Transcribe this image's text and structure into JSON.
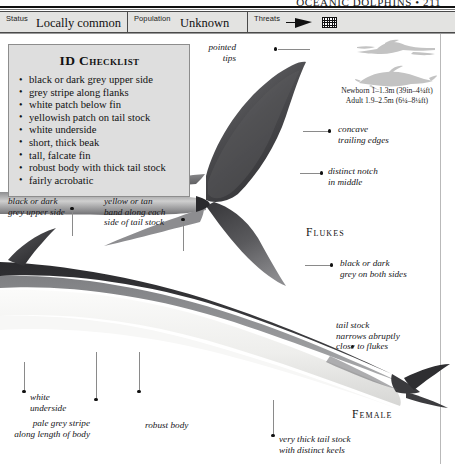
{
  "running_head": "OCEANIC DOLPHINS • 211",
  "status_bar": [
    {
      "label": "Status",
      "value": "Locally common",
      "name": "status"
    },
    {
      "label": "Population",
      "value": "Unknown",
      "name": "population"
    },
    {
      "label": "Threats",
      "value": "",
      "name": "threats",
      "icons": [
        "harpoon-icon",
        "fishing-net-icon"
      ]
    }
  ],
  "checklist": {
    "title": "ID Checklist",
    "items": [
      "black or dark grey upper side",
      "grey stripe along flanks",
      "white patch below fin",
      "yellowish patch on tail stock",
      "white underside",
      "short, thick beak",
      "tall, falcate fin",
      "robust body with thick tail stock",
      "fairly acrobatic"
    ]
  },
  "scale": {
    "newborn": "Newborn 1–1.3m (39in–4¼ft)",
    "adult": "Adult 1.9–2.5m (6¼–8¼ft)",
    "silhouettes": [
      "human-swimmer-silhouette",
      "dolphin-silhouette"
    ]
  },
  "section_labels": {
    "flukes": "Flukes",
    "female": "Female"
  },
  "callouts": {
    "pointed_tips": "pointed\ntips",
    "concave_trailing": "concave\ntrailing edges",
    "distinct_notch": "distinct notch\nin middle",
    "black_upper": "black or dark\ngrey upper side",
    "yellow_band": "yellow or tan\nband along each\nside of tail stock",
    "black_both_sides": "black or dark\ngrey on both sides",
    "tail_narrows": "tail stock\nnarrows abruptly\nclose to flukes",
    "white_underside": "white\nunderside",
    "pale_stripe": "pale grey stripe\nalong length of body",
    "robust_body": "robust body",
    "thick_tail_keels": "very thick tail stock\nwith distinct keels"
  },
  "colors": {
    "upper_body": "#3a3a3c",
    "mid_stripe": "#8f9093",
    "underside": "#f2f2f0",
    "panel_bg": "#dedede",
    "statusbar_bg": "#e3e3e1",
    "silhouette": "#c3c3c3"
  }
}
